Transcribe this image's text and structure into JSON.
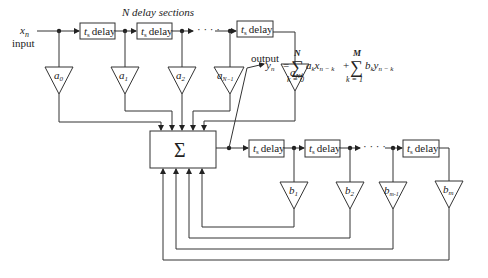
{
  "diagram": {
    "title": "N delay sections",
    "input": {
      "symbol": "x",
      "subscript": "n",
      "label": "input"
    },
    "output": {
      "label": "output"
    },
    "summer": {
      "symbol": "Σ"
    },
    "delay_label": {
      "t": "t",
      "s": "s",
      "text": "delay"
    },
    "feedforward_coeffs": [
      {
        "base": "a",
        "sub": "0"
      },
      {
        "base": "a",
        "sub": "1"
      },
      {
        "base": "a",
        "sub": "2"
      },
      {
        "base": "a",
        "sub": "N−1"
      },
      {
        "base": "a",
        "sub": "N"
      }
    ],
    "feedback_coeffs": [
      {
        "base": "b",
        "sub": "1"
      },
      {
        "base": "b",
        "sub": "2"
      },
      {
        "base": "b",
        "sub": "m-1"
      },
      {
        "base": "b",
        "sub": "m"
      }
    ],
    "ellipsis": "· · · ·",
    "equation": {
      "lhs": "y",
      "lhs_sub": "n",
      "equals": "=",
      "sum1_upper": "N",
      "sum1_lower": "k = 0",
      "term1_a": "a",
      "term1_a_sub": "k",
      "term1_x": "x",
      "term1_x_sub": "n − k",
      "plus": "+",
      "sum2_upper": "M",
      "sum2_lower": "k = 1",
      "term2_b": "b",
      "term2_b_sub": "k",
      "term2_y": "y",
      "term2_y_sub": "n − k",
      "sigma": "∑"
    }
  }
}
